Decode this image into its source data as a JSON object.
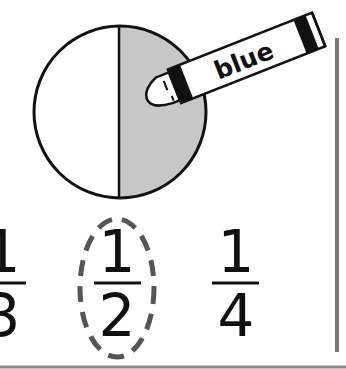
{
  "figure": {
    "circle": {
      "cx": 120,
      "cy": 112,
      "r": 86,
      "shaded_half": "right",
      "shade_color": "#c8c8c8",
      "stroke_color": "#111111",
      "parts": 2,
      "shaded_parts": 1
    },
    "crayon": {
      "label": "blue",
      "body_color": "#ffffff",
      "band_color": "#111111"
    },
    "fractions": [
      {
        "numerator": "1",
        "denominator": "3",
        "circled": false
      },
      {
        "numerator": "1",
        "denominator": "2",
        "circled": true
      },
      {
        "numerator": "1",
        "denominator": "4",
        "circled": false
      }
    ],
    "answer_circle": {
      "style": "dashed",
      "color": "#555555"
    },
    "divider_color": "#777777"
  }
}
